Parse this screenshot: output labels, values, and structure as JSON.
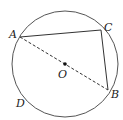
{
  "figure": {
    "type": "circle-geometry",
    "circle": {
      "center_label": "O",
      "cx": 65,
      "cy": 64,
      "r": 53
    },
    "points": {
      "A": {
        "label": "A",
        "x": 20,
        "y": 37
      },
      "B": {
        "label": "B",
        "x": 108,
        "y": 90
      },
      "C": {
        "label": "C",
        "x": 101,
        "y": 30
      },
      "D": {
        "label": "D"
      }
    },
    "segments": [
      {
        "from": "A",
        "to": "C",
        "style": "solid"
      },
      {
        "from": "C",
        "to": "B",
        "style": "solid"
      },
      {
        "from": "A",
        "to": "B",
        "style": "dashed",
        "note": "diameter through O"
      }
    ],
    "colors": {
      "stroke": "#333333",
      "label": "#222222",
      "background": "#ffffff"
    }
  }
}
